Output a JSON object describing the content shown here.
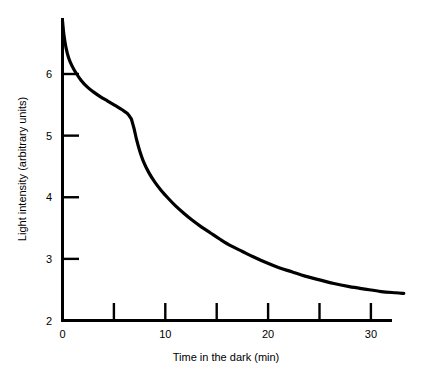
{
  "figure": {
    "background_color": "#ffffff",
    "ink_color": "#000000"
  },
  "chart_data": {
    "type": "line",
    "title": "",
    "subtitle": "",
    "xlabel": "Time in the dark (min)",
    "ylabel": "Light intensity (arbitrary units)",
    "xlim": [
      0,
      33.5
    ],
    "ylim": [
      2,
      6.9
    ],
    "grid": false,
    "legend": null,
    "legend_position": "none",
    "x_ticks_labeled": [
      0,
      10,
      20,
      30
    ],
    "x_ticks_unlabeled": [
      5,
      15,
      25
    ],
    "x_tick_labels": [
      "0",
      "10",
      "20",
      "30"
    ],
    "y_ticks_labeled": [
      2,
      3,
      4,
      5,
      6
    ],
    "y_tick_labels": [
      "2",
      "3",
      "4",
      "5",
      "6"
    ],
    "tick_direction": "inward",
    "annotations": [],
    "series": [
      {
        "name": "Dark adaptation threshold",
        "color": "#000000",
        "line_width": 3.2,
        "break_point": {
          "x": 6.7,
          "y": 5.27
        },
        "x": [
          0.0,
          0.15,
          0.35,
          0.6,
          0.9,
          1.3,
          1.8,
          2.4,
          3.0,
          3.7,
          4.4,
          5.1,
          5.8,
          6.3,
          6.7,
          6.95,
          7.2,
          7.5,
          7.9,
          8.4,
          9.0,
          9.6,
          10.3,
          11.0,
          11.8,
          12.6,
          13.5,
          14.4,
          15.4,
          16.4,
          17.5,
          18.6,
          19.8,
          21.0,
          22.3,
          23.6,
          25.0,
          26.4,
          27.9,
          29.4,
          31.0,
          32.4,
          33.2
        ],
        "y": [
          6.86,
          6.62,
          6.42,
          6.26,
          6.14,
          6.02,
          5.9,
          5.79,
          5.71,
          5.63,
          5.56,
          5.49,
          5.42,
          5.36,
          5.27,
          5.12,
          4.94,
          4.76,
          4.57,
          4.4,
          4.24,
          4.11,
          3.98,
          3.86,
          3.74,
          3.63,
          3.52,
          3.42,
          3.31,
          3.21,
          3.12,
          3.03,
          2.94,
          2.86,
          2.79,
          2.72,
          2.66,
          2.6,
          2.55,
          2.51,
          2.47,
          2.45,
          2.44
        ]
      }
    ]
  }
}
